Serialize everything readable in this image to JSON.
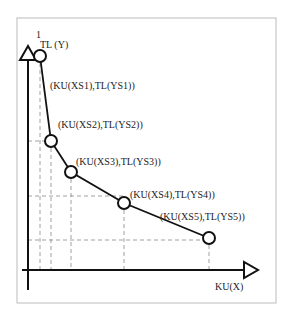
{
  "diagram": {
    "y_axis_label": "TL (Y)",
    "y_axis_top_mark": "1",
    "x_axis_label": "KU(X)",
    "points": [
      {
        "label": "(KU(XS1),TL(YS1))",
        "x": 40,
        "y": 56
      },
      {
        "label": "(KU(XS2),TL(YS2))",
        "x": 51,
        "y": 141
      },
      {
        "label": "(KU(XS3),TL(YS3))",
        "x": 71,
        "y": 172
      },
      {
        "label": "(KU(XS4),TL(YS4))",
        "x": 124,
        "y": 203
      },
      {
        "label": "(KU(XS5),TL(YS5))",
        "x": 209,
        "y": 238
      }
    ]
  }
}
